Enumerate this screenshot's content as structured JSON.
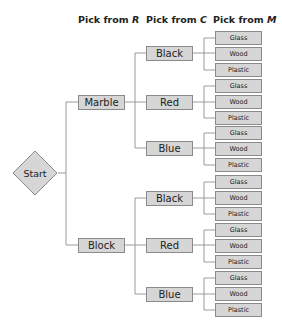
{
  "headers": {
    "r": {
      "prefix": "Pick from ",
      "var": "R"
    },
    "c": {
      "prefix": "Pick from ",
      "var": "C"
    },
    "m": {
      "prefix": "Pick from ",
      "var": "M"
    }
  },
  "start": {
    "label": "Start"
  },
  "colors": {
    "box_fill": "#d6d6d6",
    "box_border": "#8a8a8a",
    "line": "#9a9a9a"
  },
  "tree": {
    "r": [
      {
        "label": "Marble",
        "c": [
          {
            "label": "Black",
            "m": [
              "Glass",
              "Wood",
              "Plastic"
            ]
          },
          {
            "label": "Red",
            "m": [
              "Glass",
              "Wood",
              "Plastic"
            ]
          },
          {
            "label": "Blue",
            "m": [
              "Glass",
              "Wood",
              "Plastic"
            ]
          }
        ]
      },
      {
        "label": "Block",
        "c": [
          {
            "label": "Black",
            "m": [
              "Glass",
              "Wood",
              "Plastic"
            ]
          },
          {
            "label": "Red",
            "m": [
              "Glass",
              "Wood",
              "Plastic"
            ]
          },
          {
            "label": "Blue",
            "m": [
              "Glass",
              "Wood",
              "Plastic"
            ]
          }
        ]
      }
    ]
  }
}
